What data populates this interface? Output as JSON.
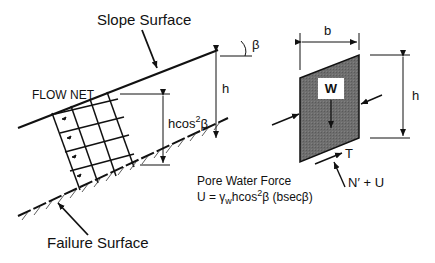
{
  "labels": {
    "slope_surface": "Slope Surface",
    "failure_surface": "Failure Surface",
    "flow_net": "FLOW NET",
    "beta": "β",
    "h_left": "h",
    "h_right": "h",
    "b": "b",
    "hcos_base": "hcos",
    "hcos_exp": "2",
    "hcos_beta": "β",
    "weight": "W",
    "shear": "T",
    "normal": "N′ + U",
    "pore_title": "Pore Water Force",
    "pore_eq_lhs": "U = γ",
    "pore_eq_sub": "w",
    "pore_eq_mid": "hcos",
    "pore_eq_exp": "2",
    "pore_eq_rhs": "β (bsecβ)"
  },
  "colors": {
    "line": "#111111",
    "block_fill": "#6e6e6e",
    "background": "#ffffff"
  }
}
